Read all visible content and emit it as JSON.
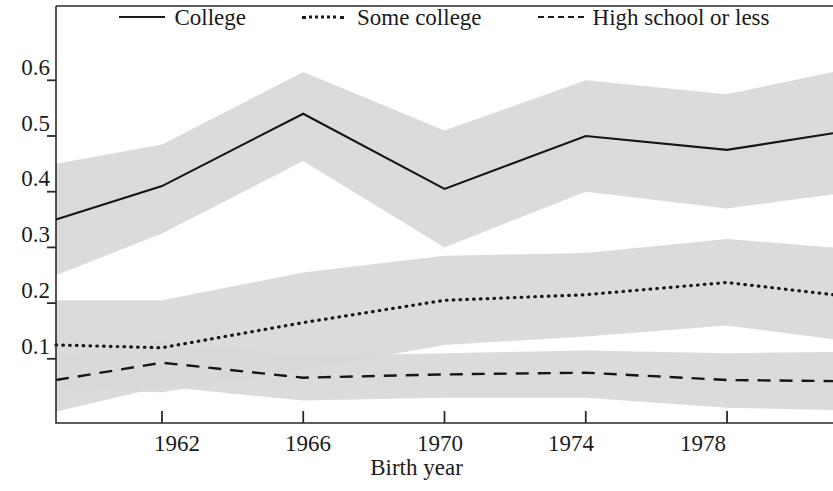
{
  "chart_data": {
    "type": "line",
    "title": "",
    "xlabel": "Birth year",
    "ylabel": "",
    "xlim": [
      1959,
      1981
    ],
    "ylim": [
      0,
      0.655
    ],
    "grid": false,
    "legend_position": "top",
    "x_ticks": [
      "1962",
      "1966",
      "1970",
      "1974",
      "1978"
    ],
    "x_tick_values": [
      1962,
      1966,
      1970,
      1974,
      1978
    ],
    "y_ticks": [
      "0.1",
      "0.2",
      "0.3",
      "0.4",
      "0.5",
      "0.6"
    ],
    "y_tick_values": [
      0.1,
      0.2,
      0.3,
      0.4,
      0.5,
      0.6
    ],
    "x": [
      1959,
      1962,
      1966,
      1970,
      1974,
      1978,
      1981
    ],
    "series": [
      {
        "name": "College",
        "style": "solid",
        "values": [
          0.35,
          0.41,
          0.54,
          0.405,
          0.5,
          0.475,
          0.505
        ],
        "band_upper": [
          0.45,
          0.485,
          0.615,
          0.51,
          0.6,
          0.575,
          0.615
        ],
        "band_lower": [
          0.25,
          0.325,
          0.455,
          0.3,
          0.4,
          0.37,
          0.395
        ]
      },
      {
        "name": "Some college",
        "style": "dotted",
        "values": [
          0.125,
          0.12,
          0.165,
          0.205,
          0.215,
          0.237,
          0.215
        ],
        "band_upper": [
          0.205,
          0.205,
          0.255,
          0.285,
          0.29,
          0.315,
          0.3
        ],
        "band_lower": [
          0.045,
          0.04,
          0.08,
          0.125,
          0.14,
          0.16,
          0.135
        ]
      },
      {
        "name": "High school or less",
        "style": "dashed",
        "values": [
          0.062,
          0.093,
          0.066,
          0.072,
          0.075,
          0.062,
          0.06
        ],
        "band_upper": [
          0.105,
          0.13,
          0.105,
          0.11,
          0.115,
          0.11,
          0.112
        ],
        "band_lower": [
          0.005,
          0.05,
          0.025,
          0.03,
          0.03,
          0.012,
          0.008
        ]
      }
    ]
  },
  "legend": {
    "items": [
      {
        "label": "College",
        "key": "solid-line-key"
      },
      {
        "label": "Some college",
        "key": "dotted-line-key"
      },
      {
        "label": "High school or less",
        "key": "dashed-line-key"
      }
    ]
  },
  "axes": {
    "x_title": "Birth year",
    "y_tick_labels": [
      "0.6",
      "0.5",
      "0.4",
      "0.3",
      "0.2",
      "0.1"
    ],
    "x_tick_labels": [
      "1962",
      "1966",
      "1970",
      "1974",
      "1978"
    ]
  }
}
